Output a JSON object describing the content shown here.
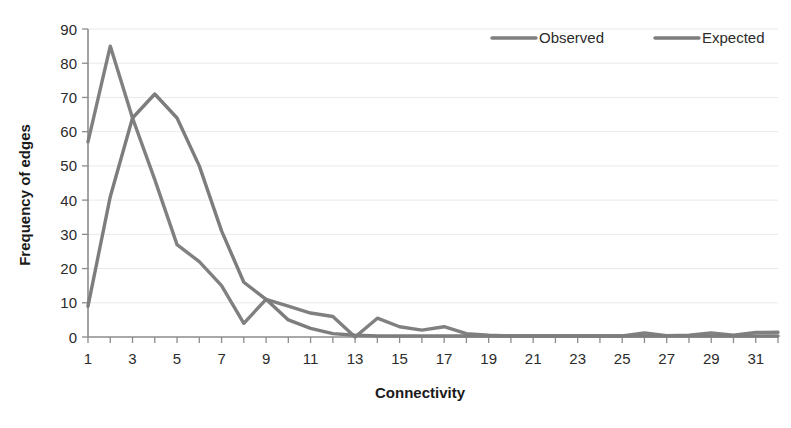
{
  "chart_data": {
    "type": "line",
    "title": "",
    "xlabel": "Connectivity",
    "ylabel": "Frequency of edges",
    "xlim": [
      1,
      32
    ],
    "ylim": [
      0,
      90
    ],
    "ytick_step": 10,
    "yticks": [
      0,
      10,
      20,
      30,
      40,
      50,
      60,
      70,
      80,
      90
    ],
    "xticks": [
      1,
      3,
      5,
      7,
      9,
      11,
      13,
      15,
      17,
      19,
      21,
      23,
      25,
      27,
      29,
      31
    ],
    "x": [
      1,
      2,
      3,
      4,
      5,
      6,
      7,
      8,
      9,
      10,
      11,
      12,
      13,
      14,
      15,
      16,
      17,
      18,
      19,
      20,
      21,
      22,
      23,
      24,
      25,
      26,
      27,
      28,
      29,
      30,
      31,
      32
    ],
    "grid": "horizontal",
    "legend_position": "top-right",
    "series": [
      {
        "name": "Observed",
        "color": "#808080",
        "values": [
          57,
          85,
          64,
          46,
          27,
          22,
          15,
          4,
          11,
          9,
          7,
          6,
          0,
          5.5,
          3,
          2,
          3,
          1,
          0.5,
          0.3,
          0.3,
          0.3,
          0.3,
          0.3,
          0.3,
          1.2,
          0.4,
          0.5,
          1.2,
          0.5,
          1.3,
          1.4
        ]
      },
      {
        "name": "Expected",
        "color": "#7d7d7d",
        "values": [
          9,
          41,
          64,
          71,
          64,
          50,
          31,
          16,
          11,
          5,
          2.5,
          1,
          0.5,
          0.3,
          0.3,
          0.3,
          0.3,
          0.3,
          0.3,
          0.3,
          0.3,
          0.3,
          0.3,
          0.3,
          0.3,
          0.3,
          0.3,
          0.3,
          0.3,
          0.3,
          0.3,
          0.3
        ]
      }
    ]
  },
  "legend": {
    "items": [
      {
        "label": "Observed"
      },
      {
        "label": "Expected"
      }
    ]
  },
  "axes": {
    "x_title": "Connectivity",
    "y_title": "Frequency of edges"
  }
}
